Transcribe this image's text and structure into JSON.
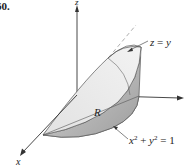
{
  "figure": {
    "number": "60.",
    "labels": {
      "surface_equation_lhs": "z",
      "surface_equation_eq": "=",
      "surface_equation_rhs": "y",
      "region": "R",
      "cylinder_x": "x",
      "cylinder_x_exp": "2",
      "cylinder_plus": "+",
      "cylinder_y": "y",
      "cylinder_y_exp": "2",
      "cylinder_eq": "=",
      "cylinder_rhs": "1",
      "x_axis": "x",
      "z_axis": "z"
    },
    "colors": {
      "axis": "#333333",
      "surface_light": "#e6e6e6",
      "surface_mid": "#cfcfcf",
      "surface_dark": "#a9a9a9",
      "edge": "#555555",
      "dashed": "#999999"
    }
  }
}
